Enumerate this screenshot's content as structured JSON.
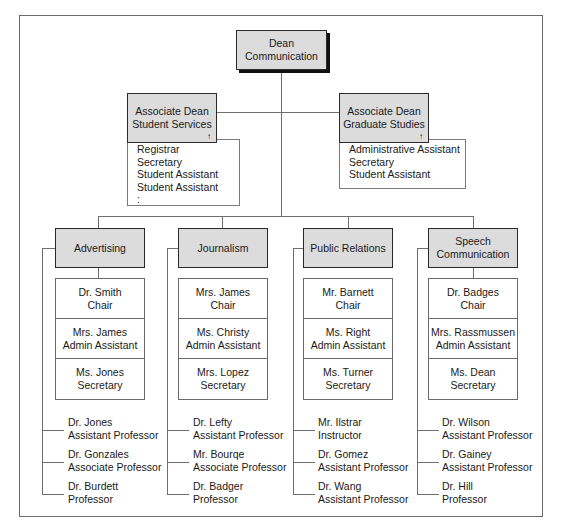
{
  "dean": {
    "line1": "Dean",
    "line2": "Communication"
  },
  "associate_deans": [
    {
      "line1": "Associate Dean",
      "line2": "Student Services",
      "marker": "↑",
      "staff": [
        "Registrar",
        "Secretary",
        "Student Assistant",
        "Student Assistant",
        ":"
      ]
    },
    {
      "line1": "Associate Dean",
      "line2": "Graduate Studies",
      "marker": "↑",
      "staff": [
        "Administrative Assistant",
        "Secretary",
        "Student Assistant"
      ]
    }
  ],
  "departments": [
    {
      "name_line1": "Advertising",
      "name_line2": "",
      "staff": [
        {
          "name": "Dr. Smith",
          "title": "Chair"
        },
        {
          "name": "Mrs. James",
          "title": "Admin Assistant"
        },
        {
          "name": "Ms. Jones",
          "title": "Secretary"
        }
      ],
      "faculty": [
        {
          "name": "Dr. Jones",
          "title": "Assistant Professor"
        },
        {
          "name": "Dr. Gonzales",
          "title": "Associate Professor"
        },
        {
          "name": "Dr. Burdett",
          "title": "Professor"
        }
      ]
    },
    {
      "name_line1": "Journalism",
      "name_line2": "",
      "staff": [
        {
          "name": "Mrs. James",
          "title": "Chair"
        },
        {
          "name": "Ms. Christy",
          "title": "Admin Assistant"
        },
        {
          "name": "Mrs. Lopez",
          "title": "Secretary"
        }
      ],
      "faculty": [
        {
          "name": "Dr. Lefty",
          "title": "Assistant Professor"
        },
        {
          "name": "Mr. Bourqe",
          "title": "Associate Professor"
        },
        {
          "name": "Dr. Badger",
          "title": "Professor"
        }
      ]
    },
    {
      "name_line1": "Public Relations",
      "name_line2": "",
      "staff": [
        {
          "name": "Mr. Barnett",
          "title": "Chair"
        },
        {
          "name": "Ms. Right",
          "title": "Admin Assistant"
        },
        {
          "name": "Ms. Turner",
          "title": "Secretary"
        }
      ],
      "faculty": [
        {
          "name": "Mr. Ilstrar",
          "title": "Instructor"
        },
        {
          "name": "Dr. Gomez",
          "title": "Assistant Professor"
        },
        {
          "name": "Dr. Wang",
          "title": "Assistant Professor"
        }
      ]
    },
    {
      "name_line1": "Speech",
      "name_line2": "Communication",
      "staff": [
        {
          "name": "Dr. Badges",
          "title": "Chair"
        },
        {
          "name": "Mrs. Rassmussen",
          "title": "Admin Assistant"
        },
        {
          "name": "Ms. Dean",
          "title": "Secretary"
        }
      ],
      "faculty": [
        {
          "name": "Dr. Wilson",
          "title": "Assistant Professor"
        },
        {
          "name": "Dr. Gainey",
          "title": "Assistant Professor"
        },
        {
          "name": "Dr. Hill",
          "title": "Professor"
        }
      ]
    }
  ],
  "colors": {
    "box_fill": "#dcdcdc",
    "line": "#6e6e6e",
    "shadow": "#111111"
  }
}
